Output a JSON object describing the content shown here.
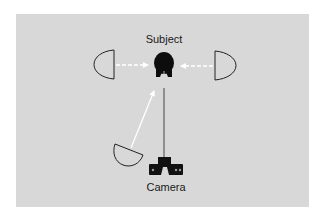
{
  "diagram": {
    "type": "lighting-setup",
    "labels": {
      "subject": "Subject",
      "camera": "Camera"
    },
    "nodes": [
      {
        "id": "subject",
        "kind": "person-head",
        "label": "Subject"
      },
      {
        "id": "camera",
        "kind": "camera",
        "label": "Camera"
      },
      {
        "id": "lamp-left",
        "kind": "lamp",
        "label": ""
      },
      {
        "id": "lamp-right",
        "kind": "lamp",
        "label": ""
      },
      {
        "id": "lamp-front-left",
        "kind": "lamp",
        "label": ""
      }
    ],
    "edges": [
      {
        "from": "lamp-left",
        "to": "subject",
        "style": "dashed-arrow"
      },
      {
        "from": "lamp-right",
        "to": "subject",
        "style": "dashed-arrow"
      },
      {
        "from": "lamp-front-left",
        "to": "subject",
        "style": "solid-arrow"
      },
      {
        "from": "camera",
        "to": "subject",
        "style": "line"
      }
    ],
    "colors": {
      "panel": "#d8d8d8",
      "ink": "#111111",
      "arrow": "#ffffff"
    }
  }
}
